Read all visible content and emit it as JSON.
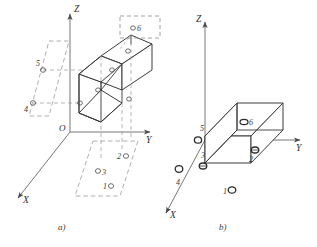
{
  "figure": {
    "title": "",
    "panels": [
      {
        "key": "a",
        "caption": "a)",
        "axes": {
          "x": "X",
          "y": "Y",
          "z": "Z",
          "origin": "O"
        },
        "callout": {
          "label": "6",
          "marker": "ρ",
          "boxed": true
        },
        "markers": [
          {
            "id": "6",
            "label": "6",
            "location": "top-face-callout"
          },
          {
            "id": "5",
            "label": "5",
            "location": "left-projection-plane-upper"
          },
          {
            "id": "4",
            "label": "4",
            "location": "left-projection-plane-lower"
          },
          {
            "id": "2",
            "label": "2",
            "location": "bottom-projection-plane-right"
          },
          {
            "id": "3",
            "label": "3",
            "location": "bottom-projection-plane-left"
          },
          {
            "id": "1",
            "label": "1",
            "location": "bottom-projection-plane-front"
          }
        ]
      },
      {
        "key": "b",
        "caption": "b)",
        "axes": {
          "x": "X",
          "y": "Y",
          "z": "Z",
          "origin": "O"
        },
        "markers": [
          {
            "id": "6",
            "label": "6",
            "location": "top-face"
          },
          {
            "id": "5",
            "label": "5",
            "location": "back-left-edge"
          },
          {
            "id": "4",
            "label": "4",
            "location": "front-left-face"
          },
          {
            "id": "3",
            "label": "3",
            "location": "left-face-middle"
          },
          {
            "id": "2",
            "label": "2",
            "location": "right-face"
          },
          {
            "id": "1",
            "label": "1",
            "location": "front-bottom-face"
          }
        ]
      }
    ]
  },
  "style": {
    "solid_stroke": "#3a3a3a",
    "dashed_stroke": "#8c8c8c",
    "axis_stroke": "#555555",
    "marker_stroke": "#2b2b2b",
    "background": "#ffffff"
  }
}
